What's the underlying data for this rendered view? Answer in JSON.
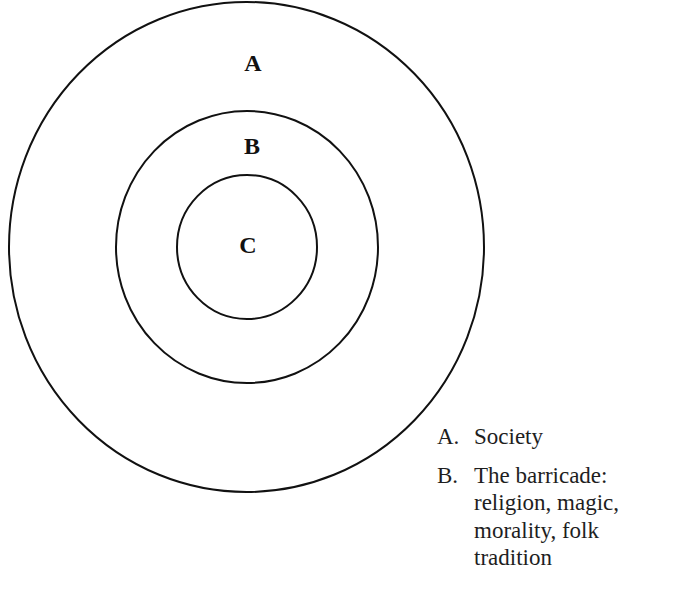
{
  "diagram": {
    "rings": [
      {
        "id": "A",
        "label": "A",
        "cx": 246.5,
        "cy": 247,
        "rx": 237.5,
        "ry": 245,
        "label_x": 253,
        "label_y": 71
      },
      {
        "id": "B",
        "label": "B",
        "cx": 247,
        "cy": 247,
        "rx": 131,
        "ry": 136,
        "label_x": 252,
        "label_y": 154
      },
      {
        "id": "C",
        "label": "C",
        "cx": 247,
        "cy": 247,
        "rx": 70,
        "ry": 72,
        "label_x": 248,
        "label_y": 253
      }
    ],
    "stroke_color": "#111111"
  },
  "legend": {
    "items": [
      {
        "key": "A.",
        "text": "Society"
      },
      {
        "key": "B.",
        "text": "The barricade:\nreligion, magic,\nmorality, folk\ntradition"
      }
    ]
  }
}
